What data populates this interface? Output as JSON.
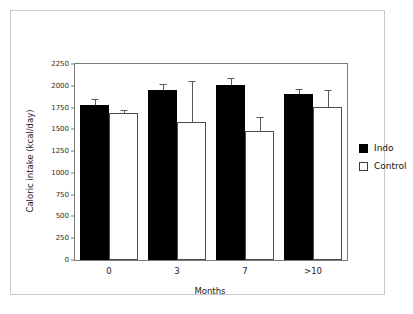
{
  "chart_data": {
    "type": "bar",
    "title": "",
    "xlabel": "Months",
    "ylabel": "Caloric intake (kcal/day)",
    "categories": [
      "0",
      "3",
      "7",
      ">10"
    ],
    "ylim": [
      0,
      2250
    ],
    "yticks": [
      0,
      250,
      500,
      750,
      1000,
      1250,
      1500,
      1750,
      2000,
      2250
    ],
    "ytick_labels": [
      "0",
      "250",
      "500",
      "750",
      "1000",
      "1250",
      "1500",
      "1750",
      "2000",
      "2250"
    ],
    "grid": false,
    "legend_position": "right",
    "series": [
      {
        "name": "Indo",
        "color": "#000000",
        "values": [
          1780,
          1955,
          2005,
          1910
        ],
        "errors": [
          65,
          60,
          80,
          55
        ]
      },
      {
        "name": "Control",
        "color": "#ffffff",
        "values": [
          1685,
          1580,
          1485,
          1760
        ],
        "errors": [
          35,
          480,
          155,
          195
        ]
      }
    ]
  },
  "legend": {
    "items": [
      {
        "label": "Indo",
        "swatch": "filled-square"
      },
      {
        "label": "Control",
        "swatch": "open-square"
      }
    ]
  }
}
